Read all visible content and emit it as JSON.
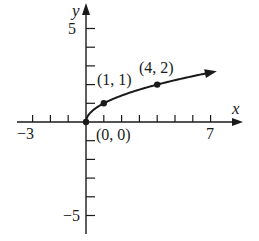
{
  "chart_data": {
    "type": "line",
    "title": "",
    "function": "y = sqrt(x)",
    "xlabel": "x",
    "ylabel": "y",
    "xlim": [
      -3,
      7
    ],
    "ylim": [
      -5,
      5
    ],
    "x_tick_labels": [
      "-3",
      "7"
    ],
    "y_tick_labels": [
      "5",
      "-5"
    ],
    "x_ticks": [
      -3,
      -2,
      -1,
      1,
      2,
      3,
      4,
      5,
      6,
      7
    ],
    "y_ticks": [
      5,
      4,
      3,
      2,
      1,
      -1,
      -2,
      -3,
      -4,
      -5
    ],
    "grid": false,
    "series": [
      {
        "name": "y = sqrt(x)",
        "x": [
          0,
          0.25,
          0.5,
          1,
          2,
          3,
          4,
          5,
          6,
          7
        ],
        "y": [
          0,
          0.5,
          0.707,
          1,
          1.414,
          1.732,
          2,
          2.236,
          2.449,
          2.646
        ]
      }
    ],
    "points": [
      {
        "x": 0,
        "y": 0,
        "label": "(0, 0)"
      },
      {
        "x": 1,
        "y": 1,
        "label": "(1, 1)"
      },
      {
        "x": 4,
        "y": 2,
        "label": "(4, 2)"
      }
    ],
    "annotations": [
      "(0, 0)",
      "(1, 1)",
      "(4, 2)"
    ]
  },
  "labels": {
    "x_axis": "x",
    "y_axis": "y",
    "x_min": "−3",
    "x_max": "7",
    "y_max": "5",
    "y_min": "−5",
    "p0": "(0, 0)",
    "p1": "(1, 1)",
    "p2": "(4, 2)"
  },
  "colors": {
    "ink": "#1a1a1a",
    "background": "#ffffff"
  }
}
